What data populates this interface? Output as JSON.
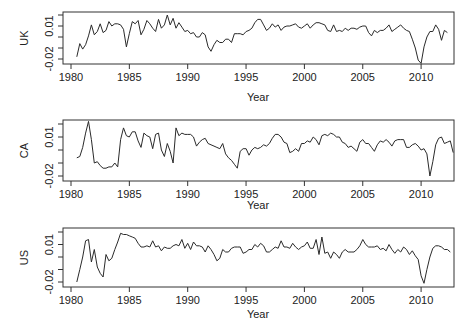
{
  "chart_data": {
    "type": "line",
    "layout": "3 stacked panels, shared x-axis range",
    "xlabel": "Year",
    "x_ticks": [
      1980,
      1985,
      1990,
      1995,
      2000,
      2005,
      2010
    ],
    "x_tick_labels": [
      "1980",
      "1985",
      "1990",
      "1995",
      "2000",
      "2005",
      "2010"
    ],
    "xlim": [
      1979.75,
      2012.5
    ],
    "y_ticks": [
      -0.02,
      -0.01,
      0.0,
      0.01,
      0.02
    ],
    "y_tick_labels_shown": [
      "-0.02",
      "0.01"
    ],
    "ylim": [
      -0.0225,
      0.022
    ],
    "grid": false,
    "legend": null,
    "x_start": 1980.5,
    "x_step": 0.25,
    "panels": [
      {
        "ylabel": "UK",
        "values": [
          -0.018,
          -0.006,
          -0.011,
          -0.007,
          0.001,
          0.011,
          0.002,
          0.005,
          0.012,
          0.004,
          0.006,
          0.014,
          0.01,
          0.012,
          0.012,
          0.011,
          0.007,
          -0.009,
          0.003,
          0.014,
          0.012,
          0.015,
          0.002,
          0.007,
          0.015,
          0.012,
          0.008,
          0.005,
          0.016,
          0.008,
          0.011,
          0.02,
          0.011,
          0.017,
          0.008,
          0.013,
          0.009,
          0.005,
          0.006,
          0.003,
          0.004,
          0.0,
          0.0,
          0.004,
          0.002,
          -0.009,
          -0.013,
          -0.007,
          -0.003,
          -0.005,
          -0.005,
          -0.002,
          -0.002,
          -0.005,
          0.003,
          0.003,
          0.003,
          0.002,
          0.005,
          0.006,
          0.008,
          0.013,
          0.016,
          0.016,
          0.011,
          0.006,
          0.008,
          0.012,
          0.009,
          0.011,
          0.006,
          0.009,
          0.01,
          0.01,
          0.011,
          0.012,
          0.009,
          0.008,
          0.01,
          0.012,
          0.008,
          0.011,
          0.013,
          0.013,
          0.012,
          0.011,
          0.006,
          0.005,
          0.011,
          0.005,
          0.006,
          0.005,
          0.008,
          0.006,
          0.008,
          0.008,
          0.007,
          0.009,
          0.01,
          0.01,
          0.004,
          0.001,
          0.006,
          0.004,
          0.006,
          0.006,
          0.008,
          0.011,
          0.005,
          0.007,
          0.009,
          0.011,
          0.008,
          0.006,
          0.005,
          -0.002,
          -0.01,
          -0.021,
          -0.024,
          -0.009,
          0.0,
          0.005,
          0.005,
          0.011,
          0.007,
          -0.003,
          0.006,
          0.004
        ],
        "note": "approximate quarterly growth read from plot"
      },
      {
        "ylabel": "CA",
        "values": [
          -0.006,
          -0.005,
          0.002,
          0.013,
          0.022,
          0.008,
          -0.01,
          -0.009,
          -0.012,
          -0.014,
          -0.014,
          -0.013,
          -0.013,
          -0.01,
          -0.013,
          0.008,
          0.017,
          0.011,
          0.01,
          0.014,
          0.014,
          0.007,
          0.002,
          0.013,
          0.011,
          0.01,
          0.001,
          0.012,
          0.013,
          0.0,
          -0.005,
          0.005,
          -0.001,
          -0.01,
          0.017,
          0.011,
          0.013,
          0.012,
          0.012,
          0.012,
          0.01,
          0.003,
          0.006,
          0.008,
          0.009,
          0.005,
          0.004,
          0.003,
          0.002,
          0.001,
          0.005,
          -0.003,
          -0.006,
          -0.008,
          -0.011,
          -0.014,
          -0.001,
          0.001,
          0.001,
          -0.004,
          0.0,
          0.002,
          0.001,
          0.002,
          0.004,
          0.003,
          0.005,
          0.009,
          0.012,
          0.012,
          0.01,
          0.006,
          0.005,
          -0.002,
          -0.001,
          0.001,
          -0.001,
          0.005,
          0.005,
          0.007,
          0.006,
          0.01,
          0.008,
          0.004,
          0.011,
          0.012,
          0.011,
          0.013,
          0.012,
          0.01,
          0.01,
          0.006,
          0.005,
          0.002,
          0.003,
          0.001,
          -0.001,
          0.006,
          0.008,
          0.005,
          0.005,
          0.002,
          -0.001,
          0.004,
          0.007,
          0.006,
          0.008,
          0.006,
          0.003,
          0.007,
          0.008,
          0.008,
          0.008,
          0.002,
          0.002,
          0.004,
          0.005,
          0.003,
          0.0,
          0.001,
          -0.003,
          -0.02,
          -0.009,
          0.004,
          0.009,
          0.01,
          0.005,
          0.006,
          0.007,
          -0.002
        ],
        "note": "approximate quarterly growth read from plot"
      },
      {
        "ylabel": "US",
        "values": [
          -0.02,
          -0.01,
          0.0,
          0.013,
          0.014,
          -0.004,
          0.006,
          -0.008,
          -0.013,
          -0.016,
          0.002,
          -0.003,
          -0.001,
          0.006,
          0.012,
          0.019,
          0.018,
          0.018,
          0.017,
          0.016,
          0.015,
          0.011,
          0.008,
          0.008,
          0.009,
          0.008,
          0.013,
          0.008,
          0.009,
          0.005,
          0.008,
          0.007,
          0.007,
          0.009,
          0.01,
          0.009,
          0.014,
          0.007,
          0.011,
          0.006,
          0.012,
          0.009,
          0.009,
          0.008,
          0.004,
          0.009,
          0.006,
          0.002,
          -0.003,
          -0.001,
          0.006,
          0.004,
          0.004,
          0.007,
          0.008,
          0.008,
          0.008,
          0.003,
          0.004,
          0.006,
          0.006,
          0.01,
          0.008,
          0.011,
          0.009,
          0.004,
          0.004,
          0.006,
          0.008,
          0.007,
          0.013,
          0.008,
          0.008,
          0.007,
          0.011,
          0.008,
          0.006,
          0.008,
          0.009,
          0.012,
          0.007,
          0.007,
          0.014,
          0.002,
          0.016,
          0.003,
          0.004,
          -0.001,
          0.004,
          0.002,
          -0.001,
          0.004,
          0.006,
          0.004,
          0.004,
          0.004,
          0.006,
          0.009,
          0.014,
          0.01,
          0.008,
          0.008,
          0.008,
          0.009,
          0.006,
          0.007,
          0.005,
          0.01,
          0.006,
          0.003,
          0.006,
          0.004,
          0.008,
          0.006,
          0.002,
          0.005,
          0.001,
          -0.002,
          -0.015,
          -0.021,
          -0.01,
          0.0,
          0.007,
          0.009,
          0.009,
          0.008,
          0.006,
          0.006,
          0.004
        ],
        "note": "approximate quarterly growth read from plot"
      }
    ]
  }
}
